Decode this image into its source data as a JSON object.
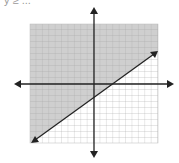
{
  "caption": "y ≥ ...",
  "graph": {
    "grid_lines": 20,
    "shaded_color": "#c8c8c8",
    "grid_color": "#9a9a9a",
    "axis_color": "#222222",
    "boundary": "solid line with positive slope",
    "shaded_region": "above the line"
  }
}
